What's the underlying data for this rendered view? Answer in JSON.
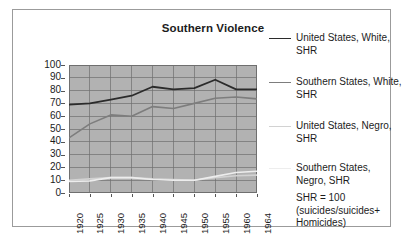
{
  "frame": {
    "border_color": "#9b9b9b"
  },
  "title": "Southern Violence",
  "legend": {
    "entries": [
      {
        "label": "United States, White, SHR",
        "color": "#2b2b2b",
        "width": 1.8
      },
      {
        "label": "Southern States, White, SHR",
        "color": "#7d7d7d",
        "width": 1.6
      },
      {
        "label": "United States, Negro, SHR",
        "color": "#d2d2d2",
        "width": 1.6
      },
      {
        "label": "Southern States, Negro, SHR",
        "color": "#ededed",
        "width": 1.6
      }
    ],
    "note_lines": [
      "SHR = 100",
      "(suicides/suicides+",
      "Homicides)"
    ]
  },
  "chart_data": {
    "type": "line",
    "title": "Southern Violence",
    "xlabel": "",
    "ylabel": "",
    "ylim": [
      0,
      100
    ],
    "ytick_step": 10,
    "yticks": [
      0,
      10,
      20,
      30,
      40,
      50,
      60,
      70,
      80,
      90,
      100
    ],
    "categories": [
      "1920",
      "1925",
      "1930",
      "1935",
      "1940",
      "1945",
      "1950",
      "1955",
      "1960",
      "1964"
    ],
    "grid": true,
    "legend_position": "right",
    "plot_bg": "#b2b2b2",
    "grid_color": "#6f6f6f",
    "series": [
      {
        "name": "United States, White, SHR",
        "color": "#2b2b2b",
        "width": 1.8,
        "values": [
          69,
          70,
          73,
          76,
          83,
          81,
          82,
          88.5,
          81,
          81
        ]
      },
      {
        "name": "Southern States, White, SHR",
        "color": "#7d7d7d",
        "width": 1.6,
        "values": [
          43,
          54,
          61,
          60,
          67.5,
          66,
          70,
          74,
          75,
          73.5
        ]
      },
      {
        "name": "United States, Negro, SHR",
        "color": "#d2d2d2",
        "width": 1.6,
        "values": [
          10,
          11,
          12,
          12,
          11,
          10.5,
          10,
          12,
          13.5,
          14
        ]
      },
      {
        "name": "Southern States, Negro, SHR",
        "color": "#ededed",
        "width": 1.6,
        "values": [
          9,
          9.5,
          12,
          12,
          10.5,
          10,
          10,
          13,
          16,
          17
        ]
      }
    ],
    "annotation": "SHR = 100 (suicides/suicides+ Homicides)"
  }
}
